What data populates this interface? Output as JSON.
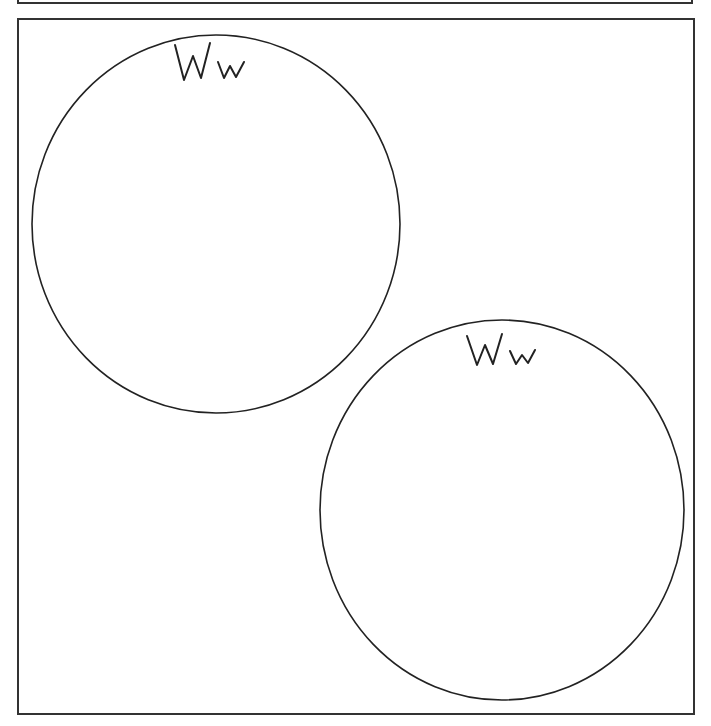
{
  "worksheet": {
    "circles": [
      {
        "label": "Ww",
        "cx": 216,
        "cy": 224,
        "rx": 184,
        "ry": 189
      },
      {
        "label": "Ww",
        "cx": 502,
        "cy": 510,
        "rx": 182,
        "ry": 190
      }
    ],
    "colors": {
      "stroke": "#222222",
      "background": "#ffffff"
    }
  }
}
